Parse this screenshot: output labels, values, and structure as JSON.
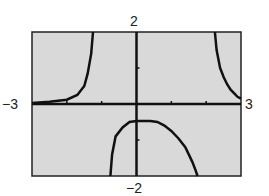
{
  "chart_data": {
    "type": "line",
    "title": "",
    "xlabel": "",
    "ylabel": "",
    "xlim": [
      -3,
      3
    ],
    "ylim": [
      -2,
      2
    ],
    "x_tick_labels": [
      "-3",
      "3"
    ],
    "y_tick_labels": [
      "-2",
      "2"
    ],
    "x_tick_marks": [
      -2,
      -1,
      1,
      2
    ],
    "y_tick_marks": [
      -1,
      1
    ],
    "grid": false,
    "legend": null,
    "background_color": "#d9d9d9",
    "curve_color": "#111111",
    "series": [
      {
        "name": "left branch",
        "x": [
          -3.0,
          -2.5,
          -2.0,
          -1.7,
          -1.5,
          -1.4,
          -1.3,
          -1.25
        ],
        "y": [
          0.03,
          0.06,
          0.12,
          0.25,
          0.5,
          0.85,
          1.4,
          2.0
        ]
      },
      {
        "name": "middle branch",
        "x": [
          -0.75,
          -0.7,
          -0.6,
          -0.4,
          -0.2,
          0.0,
          0.2,
          0.4,
          0.6,
          0.8,
          1.0,
          1.2,
          1.4,
          1.6,
          1.7,
          1.75
        ],
        "y": [
          -2.0,
          -1.4,
          -0.9,
          -0.65,
          -0.5,
          -0.47,
          -0.47,
          -0.47,
          -0.5,
          -0.6,
          -0.75,
          -0.95,
          -1.2,
          -1.6,
          -1.85,
          -2.0
        ]
      },
      {
        "name": "right branch",
        "x": [
          2.25,
          2.3,
          2.4,
          2.5,
          2.6,
          2.7,
          2.8,
          2.9,
          3.0
        ],
        "y": [
          2.0,
          1.5,
          1.0,
          0.75,
          0.55,
          0.4,
          0.3,
          0.2,
          0.15
        ]
      }
    ],
    "vertical_asymptotes_approx": [
      -1.25,
      2.25
    ]
  },
  "labels": {
    "ymax": "2",
    "ymin": "-2",
    "xmin": "-3",
    "xmax": "3"
  }
}
